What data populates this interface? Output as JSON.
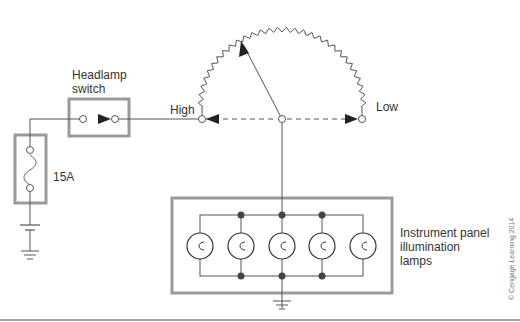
{
  "diagram": {
    "labels": {
      "headlamp_switch": [
        "Headlamp",
        "switch"
      ],
      "fuse_rating": "15A",
      "high": "High",
      "low": "Low",
      "instrument_panel": [
        "Instrument panel",
        "illumination",
        "lamps"
      ],
      "copyright": "© Cengage Learning 2014"
    },
    "lamp_count": 5,
    "colors": {
      "wire": "#555555",
      "box": "#9a9a9a",
      "node": "#444444",
      "arrow": "#222222"
    }
  }
}
